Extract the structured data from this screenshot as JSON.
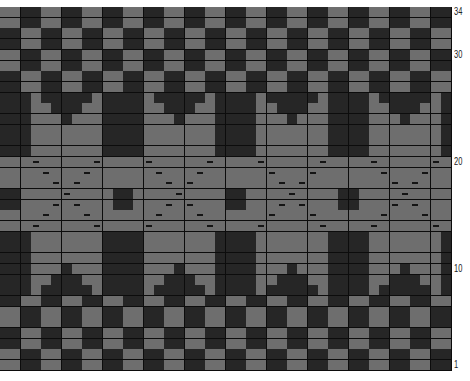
{
  "chart_title": "Colorwork knitting chart",
  "grid": {
    "rows": 34,
    "cols": 44,
    "cell_width": 10.25,
    "cell_height": 10.7,
    "repeat_width": 11,
    "colors": {
      "dark": "#262626",
      "light": "#6e6e6e",
      "gridline": "#0c0c0c",
      "dash": "#141414"
    },
    "symbols": {
      "dash": "purl / alternate-stitch marker"
    }
  },
  "row_labels": [
    {
      "label": "34",
      "row": 34
    },
    {
      "label": "30",
      "row": 30
    },
    {
      "label": "20",
      "row": 20
    },
    {
      "label": "10",
      "row": 10
    },
    {
      "label": "1",
      "row": 1
    }
  ],
  "footer_text": "",
  "pattern_rows_top_to_bottom": [
    "checkerA",
    "checkerA",
    "checkerB",
    "checkerB",
    "checkerA",
    "checkerA",
    "checkerB",
    "checkerB",
    "v1",
    "v2",
    "v3",
    "mot",
    "mot",
    "mot",
    "band0",
    "band1",
    "band2",
    "band3",
    "band4",
    "band5",
    "band6",
    "mot",
    "mot",
    "mot",
    "v3",
    "v2",
    "v1",
    "checkerB",
    "checkerA",
    "checkerA",
    "checkerB",
    "checkerB",
    "checkerA",
    "checkerA"
  ],
  "motif_light_cols_in_repeat": {
    "v1": [
      3,
      9
    ],
    "v2": [
      3,
      4,
      8,
      9
    ],
    "v3": [
      3,
      4,
      5,
      7,
      8,
      9
    ],
    "mot": [
      3,
      4,
      5,
      6,
      7,
      8,
      9
    ]
  },
  "band": {
    "dash_cols_in_repeat": {
      "band0": [
        3,
        9
      ],
      "band1": [
        4,
        8
      ],
      "band2": [
        5,
        7
      ],
      "band3": [
        6
      ],
      "band4": [
        5,
        7
      ],
      "band5": [
        4,
        8
      ],
      "band6": [
        3,
        9
      ]
    },
    "dark_block_cols_in_repeat": [
      0,
      1
    ],
    "dark_block_rows": [
      "band3",
      "band4"
    ]
  }
}
